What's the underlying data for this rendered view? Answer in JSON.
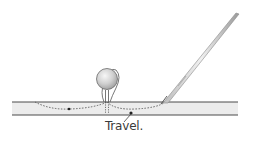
{
  "diagram": {
    "label": "Travel.",
    "colors": {
      "line": "#4a4a4a",
      "fabric_fill": "#ececec",
      "thread": "#555555",
      "ball_fill": "#d4d4d4",
      "ball_highlight": "#f2f2f2",
      "needle": "#8a8a8a",
      "text": "#3a3a3a"
    },
    "elements": [
      {
        "name": "fabric-layer",
        "description": "horizontal band between two lines"
      },
      {
        "name": "pin-head",
        "description": "round ball pin at center-left"
      },
      {
        "name": "needle",
        "description": "diagonal needle at right"
      },
      {
        "name": "thread-path",
        "description": "dashed thread travelling inside fabric"
      },
      {
        "name": "travel-arrow",
        "description": "leader line pointing at thread"
      }
    ]
  }
}
